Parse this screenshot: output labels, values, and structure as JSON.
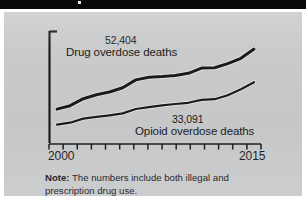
{
  "banner": {
    "mark": ""
  },
  "figure": {
    "note_prefix": "Note:",
    "note_text": " The numbers include both illegal and prescription drug use."
  },
  "chart_data": {
    "type": "line",
    "title": "",
    "xlabel": "",
    "ylabel": "",
    "xlim": [
      2000,
      2015
    ],
    "ylim": [
      0,
      60000
    ],
    "grid": false,
    "legend": "inline-annotations",
    "x_tick_labels": [
      "2000",
      "2015"
    ],
    "x_ticks_count": 16,
    "annotations": [
      {
        "value_label": "52,404",
        "series_label": "Drug overdose deaths"
      },
      {
        "value_label": "33,091",
        "series_label": "Opioid overdose deaths"
      }
    ],
    "x": [
      2000,
      2001,
      2002,
      2003,
      2004,
      2005,
      2006,
      2007,
      2008,
      2009,
      2010,
      2011,
      2012,
      2013,
      2014,
      2015
    ],
    "series": [
      {
        "name": "Drug overdose deaths",
        "color": "#1a1b1d",
        "values": [
          17400,
          19400,
          23500,
          25800,
          27400,
          29800,
          34400,
          36000,
          36400,
          37000,
          38300,
          41300,
          41500,
          43900,
          47000,
          52404
        ]
      },
      {
        "name": "Opioid overdose deaths",
        "color": "#1a1b1d",
        "values": [
          8400,
          9500,
          11900,
          12900,
          13800,
          14900,
          17500,
          18500,
          19600,
          20400,
          21100,
          22800,
          23200,
          25500,
          29000,
          33091
        ]
      }
    ]
  }
}
